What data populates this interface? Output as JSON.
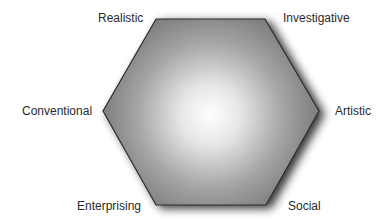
{
  "diagram": {
    "type": "hexagon",
    "vertices": {
      "top_left": "Realistic",
      "top_right": "Investigative",
      "right": "Artistic",
      "bottom_right": "Social",
      "bottom_left": "Enterprising",
      "left": "Conventional"
    },
    "labels": [
      {
        "id": "realistic",
        "text": "Realistic"
      },
      {
        "id": "investigative",
        "text": "Investigative"
      },
      {
        "id": "artistic",
        "text": "Artistic"
      },
      {
        "id": "social",
        "text": "Social"
      },
      {
        "id": "enterprising",
        "text": "Enterprising"
      },
      {
        "id": "conventional",
        "text": "Conventional"
      }
    ],
    "colors": {
      "fill_center": "#ffffff",
      "fill_edge": "#6e6e6e",
      "stroke": "#2a2a2a",
      "text": "#2a2a2a"
    }
  }
}
